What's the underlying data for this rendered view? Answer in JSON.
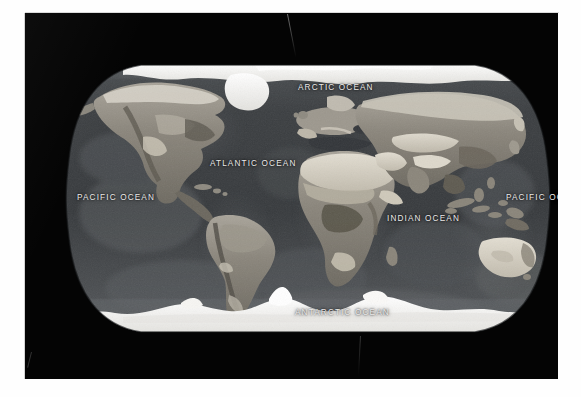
{
  "image": {
    "kind": "world-map-photograph",
    "description": "Grayscale satellite-composite world map in a Robinson-style projection, printed on a black plate with a white scan border",
    "projection": "Robinson",
    "palette": {
      "page_border": "#fefefe",
      "plate_background": "#040404",
      "deep_ocean": "#3a3d40",
      "shallow_ocean": "#55585b",
      "land_dark": "#4a4743",
      "land_mid": "#8e8a82",
      "land_light": "#c9c4ba",
      "desert": "#ddd8cc",
      "ice": "#f4f3f0",
      "label_text": "#eceaea"
    }
  },
  "map": {
    "labels": [
      {
        "id": "arctic-ocean",
        "text": "ARCTIC OCEAN",
        "x": 273,
        "y": 71
      },
      {
        "id": "atlantic-ocean",
        "text": "ATLANTIC OCEAN",
        "x": 185,
        "y": 147
      },
      {
        "id": "pacific-ocean-w",
        "text": "PACIFIC OCEAN",
        "x": 52,
        "y": 181
      },
      {
        "id": "pacific-ocean-e",
        "text": "PACIFIC OCEAN",
        "x": 481,
        "y": 181
      },
      {
        "id": "indian-ocean",
        "text": "INDIAN OCEAN",
        "x": 362,
        "y": 202
      },
      {
        "id": "antarctic-ocean",
        "text": "ANTARCTIC OCEAN",
        "x": 270,
        "y": 296
      }
    ],
    "features": {
      "ice_caps": [
        "Arctic sea ice",
        "Greenland ice sheet",
        "Antarctic ice sheet"
      ],
      "continents": [
        "North America",
        "South America",
        "Africa",
        "Europe",
        "Asia",
        "Australia",
        "Antarctica"
      ]
    }
  }
}
